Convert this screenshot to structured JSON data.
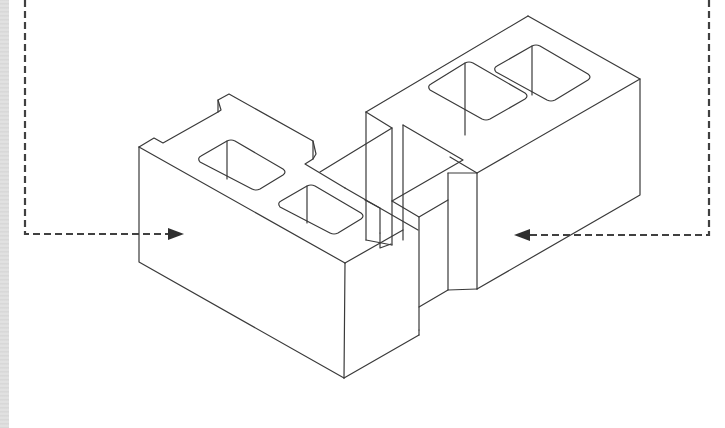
{
  "diagram": {
    "caption": "",
    "colors": {
      "line": "#3a3a3a",
      "dashed_arrow": "#404040",
      "background": "#ffffff",
      "edge_strip": "#dcdcdc"
    },
    "elements": {
      "left_block": "Block with notched end and two cores",
      "right_block": "Block with two cores, perpendicular to left block",
      "left_arrow": "Dashed leader arrow pointing right to left block face",
      "right_arrow": "Dashed leader arrow pointing left to right block face"
    }
  }
}
